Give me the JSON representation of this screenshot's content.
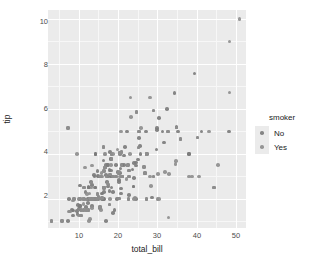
{
  "chart_data": {
    "type": "scatter",
    "title": "",
    "xlabel": "total_bill",
    "ylabel": "tip",
    "xlim": [
      2.2,
      52.5
    ],
    "ylim": [
      0.7,
      10.4
    ],
    "xticks": [
      10,
      20,
      30,
      40,
      50
    ],
    "yticks": [
      2,
      4,
      6,
      8,
      10
    ],
    "grid": true,
    "panel_background": "#EBEBEB",
    "gridline_color": "#FFFFFF",
    "legend": {
      "title": "smoker",
      "position": "right",
      "entries": [
        {
          "label": "No",
          "color": "#7C7C7C"
        },
        {
          "label": "Yes",
          "color": "#8E8E8E"
        }
      ]
    },
    "series": [
      {
        "name": "No",
        "color": "#7C7C7C",
        "points": [
          [
            16.99,
            1.01
          ],
          [
            10.34,
            1.66
          ],
          [
            21.01,
            3.5
          ],
          [
            23.68,
            3.31
          ],
          [
            24.59,
            3.61
          ],
          [
            25.29,
            4.71
          ],
          [
            8.77,
            2.0
          ],
          [
            26.88,
            3.12
          ],
          [
            15.04,
            1.96
          ],
          [
            14.78,
            3.23
          ],
          [
            10.27,
            1.71
          ],
          [
            35.26,
            5.0
          ],
          [
            15.42,
            1.57
          ],
          [
            18.43,
            3.0
          ],
          [
            14.83,
            3.02
          ],
          [
            21.58,
            3.92
          ],
          [
            10.33,
            1.67
          ],
          [
            16.29,
            3.71
          ],
          [
            16.97,
            3.5
          ],
          [
            20.65,
            3.35
          ],
          [
            17.92,
            4.08
          ],
          [
            20.29,
            2.75
          ],
          [
            15.77,
            2.23
          ],
          [
            39.42,
            7.58
          ],
          [
            19.82,
            3.18
          ],
          [
            17.81,
            2.34
          ],
          [
            13.37,
            2.0
          ],
          [
            12.69,
            2.0
          ],
          [
            21.7,
            4.3
          ],
          [
            9.55,
            1.45
          ],
          [
            18.35,
            2.5
          ],
          [
            15.06,
            3.0
          ],
          [
            20.69,
            2.45
          ],
          [
            17.78,
            3.27
          ],
          [
            24.06,
            3.6
          ],
          [
            16.31,
            2.0
          ],
          [
            16.93,
            3.07
          ],
          [
            18.69,
            2.31
          ],
          [
            31.27,
            5.0
          ],
          [
            16.04,
            2.24
          ],
          [
            17.46,
            2.54
          ],
          [
            13.94,
            3.06
          ],
          [
            9.68,
            1.32
          ],
          [
            30.4,
            5.6
          ],
          [
            18.29,
            3.0
          ],
          [
            22.23,
            5.0
          ],
          [
            32.4,
            6.0
          ],
          [
            28.55,
            2.05
          ],
          [
            18.04,
            3.0
          ],
          [
            12.54,
            2.5
          ],
          [
            10.29,
            2.6
          ],
          [
            34.81,
            5.2
          ],
          [
            9.94,
            1.56
          ],
          [
            25.56,
            4.34
          ],
          [
            19.49,
            3.51
          ],
          [
            20.49,
            4.06
          ],
          [
            35.83,
            4.67
          ],
          [
            29.03,
            5.92
          ],
          [
            27.18,
            2.0
          ],
          [
            22.67,
            2.0
          ],
          [
            17.82,
            1.75
          ],
          [
            18.78,
            3.0
          ],
          [
            7.25,
            1.0
          ],
          [
            38.07,
            4.0
          ],
          [
            23.95,
            2.55
          ],
          [
            25.71,
            4.0
          ],
          [
            17.31,
            3.5
          ],
          [
            29.93,
            5.07
          ],
          [
            10.65,
            1.5
          ],
          [
            12.43,
            1.8
          ],
          [
            24.08,
            2.92
          ],
          [
            11.69,
            2.31
          ],
          [
            13.42,
            1.68
          ],
          [
            14.26,
            2.5
          ],
          [
            15.95,
            2.0
          ],
          [
            12.48,
            2.52
          ],
          [
            29.8,
            4.2
          ],
          [
            8.52,
            1.48
          ],
          [
            14.52,
            2.0
          ],
          [
            11.38,
            2.0
          ],
          [
            22.82,
            2.18
          ],
          [
            19.08,
            1.5
          ],
          [
            20.27,
            2.83
          ],
          [
            11.17,
            1.5
          ],
          [
            12.26,
            2.0
          ],
          [
            18.26,
            3.25
          ],
          [
            8.51,
            1.25
          ],
          [
            10.33,
            2.0
          ],
          [
            14.15,
            2.0
          ],
          [
            13.16,
            2.75
          ],
          [
            17.47,
            3.5
          ],
          [
            34.3,
            6.7
          ],
          [
            41.19,
            5.0
          ],
          [
            27.05,
            5.0
          ],
          [
            16.43,
            2.3
          ],
          [
            8.35,
            1.5
          ],
          [
            18.64,
            1.36
          ],
          [
            11.87,
            1.63
          ],
          [
            9.78,
            1.73
          ],
          [
            7.51,
            2.0
          ],
          [
            14.07,
            2.5
          ],
          [
            13.13,
            2.0
          ],
          [
            17.26,
            2.74
          ],
          [
            24.55,
            2.0
          ],
          [
            19.77,
            2.0
          ],
          [
            29.85,
            5.14
          ],
          [
            48.17,
            5.0
          ],
          [
            25.0,
            3.75
          ],
          [
            13.39,
            2.61
          ],
          [
            16.49,
            2.0
          ],
          [
            21.5,
            3.5
          ],
          [
            12.66,
            2.5
          ],
          [
            16.21,
            2.0
          ],
          [
            13.81,
            2.0
          ],
          [
            17.51,
            3.0
          ],
          [
            24.52,
            3.48
          ],
          [
            20.76,
            2.24
          ],
          [
            31.71,
            4.5
          ],
          [
            16.4,
            2.5
          ],
          [
            20.53,
            4.0
          ],
          [
            16.47,
            3.23
          ],
          [
            26.59,
            3.41
          ],
          [
            18.24,
            3.76
          ],
          [
            14.31,
            4.0
          ],
          [
            20.53,
            3.16
          ],
          [
            16.66,
            3.4
          ],
          [
            17.59,
            2.64
          ],
          [
            20.08,
            3.15
          ],
          [
            16.45,
            2.47
          ],
          [
            3.07,
            1.0
          ],
          [
            20.23,
            2.01
          ],
          [
            15.01,
            2.09
          ],
          [
            12.02,
            1.97
          ],
          [
            17.07,
            3.0
          ],
          [
            26.86,
            3.14
          ],
          [
            25.28,
            5.0
          ],
          [
            14.73,
            2.2
          ],
          [
            10.51,
            1.25
          ],
          [
            17.92,
            3.08
          ],
          [
            27.2,
            4.0
          ],
          [
            22.76,
            3.0
          ],
          [
            17.29,
            2.71
          ],
          [
            19.44,
            3.0
          ],
          [
            16.66,
            3.4
          ],
          [
            32.68,
            5.0
          ],
          [
            15.98,
            2.03
          ],
          [
            34.83,
            5.17
          ],
          [
            13.03,
            2.0
          ],
          [
            18.28,
            4.0
          ],
          [
            24.71,
            5.85
          ],
          [
            21.16,
            3.0
          ],
          [
            28.97,
            3.0
          ],
          [
            22.49,
            3.5
          ],
          [
            5.75,
            1.0
          ],
          [
            16.32,
            4.3
          ],
          [
            22.75,
            3.25
          ],
          [
            40.17,
            4.73
          ],
          [
            27.28,
            4.0
          ],
          [
            12.03,
            1.5
          ],
          [
            21.01,
            3.0
          ],
          [
            12.46,
            1.5
          ],
          [
            11.35,
            2.5
          ],
          [
            15.38,
            3.0
          ],
          [
            44.3,
            2.5
          ],
          [
            22.42,
            3.48
          ],
          [
            20.92,
            4.08
          ],
          [
            15.36,
            1.64
          ],
          [
            20.49,
            4.06
          ],
          [
            25.21,
            4.29
          ],
          [
            18.24,
            3.76
          ],
          [
            14.31,
            4.0
          ],
          [
            14.0,
            3.0
          ],
          [
            7.25,
            5.15
          ],
          [
            38.07,
            4.0
          ],
          [
            23.95,
            2.55
          ]
        ]
      },
      {
        "name": "Yes",
        "color": "#8E8E8E",
        "points": [
          [
            38.01,
            3.0
          ],
          [
            11.24,
            1.76
          ],
          [
            20.29,
            3.21
          ],
          [
            13.81,
            2.0
          ],
          [
            11.02,
            1.98
          ],
          [
            18.29,
            3.76
          ],
          [
            17.59,
            2.64
          ],
          [
            20.08,
            3.15
          ],
          [
            16.45,
            2.47
          ],
          [
            3.07,
            1.0
          ],
          [
            20.23,
            2.01
          ],
          [
            15.01,
            2.09
          ],
          [
            12.02,
            1.97
          ],
          [
            17.07,
            3.0
          ],
          [
            26.86,
            3.14
          ],
          [
            25.28,
            5.0
          ],
          [
            14.73,
            2.2
          ],
          [
            10.51,
            1.25
          ],
          [
            17.92,
            3.08
          ],
          [
            27.2,
            4.0
          ],
          [
            22.76,
            3.0
          ],
          [
            17.29,
            2.71
          ],
          [
            19.44,
            3.0
          ],
          [
            16.66,
            3.4
          ],
          [
            32.68,
            5.0
          ],
          [
            15.98,
            2.03
          ],
          [
            34.83,
            5.17
          ],
          [
            13.03,
            2.0
          ],
          [
            18.28,
            4.0
          ],
          [
            24.71,
            5.85
          ],
          [
            21.16,
            3.0
          ],
          [
            28.97,
            3.0
          ],
          [
            22.49,
            3.5
          ],
          [
            5.75,
            1.0
          ],
          [
            16.32,
            4.3
          ],
          [
            22.75,
            3.25
          ],
          [
            40.17,
            4.73
          ],
          [
            27.28,
            4.0
          ],
          [
            12.03,
            1.5
          ],
          [
            21.01,
            3.0
          ],
          [
            12.46,
            1.5
          ],
          [
            11.35,
            2.5
          ],
          [
            15.38,
            3.0
          ],
          [
            44.3,
            2.5
          ],
          [
            22.42,
            3.48
          ],
          [
            20.92,
            4.08
          ],
          [
            15.36,
            1.64
          ],
          [
            20.49,
            4.06
          ],
          [
            25.21,
            4.29
          ],
          [
            50.81,
            10.0
          ],
          [
            15.81,
            3.16
          ],
          [
            7.25,
            5.15
          ],
          [
            31.85,
            3.18
          ],
          [
            16.82,
            4.0
          ],
          [
            32.9,
            3.11
          ],
          [
            17.89,
            2.0
          ],
          [
            14.48,
            2.0
          ],
          [
            9.6,
            4.0
          ],
          [
            34.63,
            3.55
          ],
          [
            34.65,
            3.68
          ],
          [
            23.33,
            5.65
          ],
          [
            45.35,
            3.5
          ],
          [
            23.17,
            6.5
          ],
          [
            40.55,
            3.0
          ],
          [
            20.69,
            5.0
          ],
          [
            20.9,
            3.5
          ],
          [
            30.46,
            2.0
          ],
          [
            18.15,
            3.5
          ],
          [
            23.1,
            4.0
          ],
          [
            15.69,
            1.5
          ],
          [
            19.81,
            4.19
          ],
          [
            28.44,
            2.56
          ],
          [
            15.48,
            2.02
          ],
          [
            16.58,
            4.0
          ],
          [
            7.56,
            1.44
          ],
          [
            10.34,
            2.0
          ],
          [
            43.11,
            5.0
          ],
          [
            13.0,
            2.0
          ],
          [
            13.51,
            2.0
          ],
          [
            18.71,
            4.0
          ],
          [
            12.74,
            2.01
          ],
          [
            13.0,
            2.0
          ],
          [
            16.4,
            2.5
          ],
          [
            20.53,
            4.0
          ],
          [
            16.47,
            3.23
          ],
          [
            26.59,
            3.41
          ],
          [
            38.73,
            3.0
          ],
          [
            24.27,
            2.03
          ],
          [
            12.76,
            2.23
          ],
          [
            30.06,
            2.0
          ],
          [
            25.89,
            5.16
          ],
          [
            48.33,
            9.0
          ],
          [
            13.27,
            2.5
          ],
          [
            28.17,
            6.5
          ],
          [
            12.9,
            1.1
          ],
          [
            28.15,
            3.0
          ],
          [
            11.59,
            1.5
          ],
          [
            7.74,
            1.44
          ],
          [
            30.14,
            3.09
          ],
          [
            12.16,
            2.2
          ],
          [
            13.42,
            3.48
          ],
          [
            8.58,
            1.92
          ],
          [
            15.98,
            3.0
          ],
          [
            13.42,
            1.58
          ],
          [
            16.27,
            2.5
          ],
          [
            10.09,
            2.0
          ],
          [
            20.45,
            3.0
          ],
          [
            13.28,
            2.72
          ],
          [
            22.12,
            2.88
          ],
          [
            24.01,
            2.0
          ],
          [
            15.69,
            3.0
          ],
          [
            11.61,
            3.39
          ],
          [
            10.77,
            1.47
          ],
          [
            15.53,
            3.0
          ],
          [
            10.07,
            1.25
          ],
          [
            12.6,
            1.0
          ],
          [
            32.83,
            1.17
          ],
          [
            35.83,
            4.67
          ],
          [
            29.03,
            5.92
          ],
          [
            27.18,
            2.0
          ],
          [
            22.67,
            2.0
          ],
          [
            17.82,
            1.75
          ],
          [
            18.78,
            3.0
          ],
          [
            48.27,
            6.73
          ],
          [
            8.77,
            2.0
          ]
        ]
      }
    ]
  }
}
